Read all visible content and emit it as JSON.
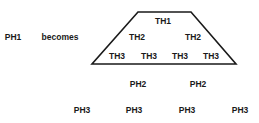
{
  "left": {
    "ph1": "PH1",
    "becomes": "becomes"
  },
  "trapezoid": {
    "th1": "TH1",
    "th2": [
      "TH2",
      "TH2"
    ],
    "th3": [
      "TH3",
      "TH3",
      "TH3",
      "TH3"
    ]
  },
  "below": {
    "ph2": [
      "PH2",
      "PH2"
    ],
    "ph3": [
      "PH3",
      "PH3",
      "PH3",
      "PH3"
    ]
  },
  "colors": {
    "stroke": "#1a1a1a",
    "text": "#1a1a1a",
    "background": "#ffffff"
  }
}
